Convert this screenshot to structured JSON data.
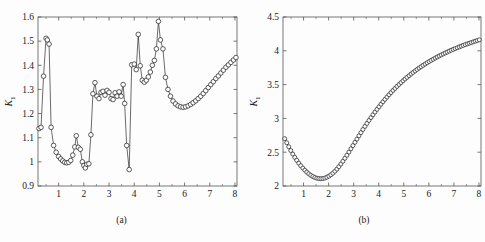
{
  "figure": {
    "background": "#fdfdfd",
    "line_color": "#2b2b2b",
    "marker_edge_color": "#1a1a1a",
    "marker_face_color": "#ffffff",
    "axis_color": "#555555"
  },
  "panels": [
    {
      "id": "a",
      "caption": "(a)",
      "xlabel": "τ",
      "ylabel_base": "K",
      "ylabel_sub": "1"
    },
    {
      "id": "b",
      "caption": "(b)",
      "xlabel": "τ",
      "ylabel_base": "K",
      "ylabel_sub": "1"
    }
  ],
  "chart_data": [
    {
      "type": "line",
      "panel": "a",
      "title": "",
      "subtitle": "(a)",
      "xlabel": "τ",
      "ylabel": "K₁",
      "xlim": [
        0.18,
        8.08
      ],
      "ylim": [
        0.9,
        1.6
      ],
      "xticks": [
        1,
        2,
        3,
        4,
        5,
        6,
        7,
        8
      ],
      "xticklabels": [
        "1",
        "2",
        "3",
        "4",
        "5",
        "6",
        "7",
        "8"
      ],
      "yticks": [
        0.9,
        1.0,
        1.1,
        1.2,
        1.3,
        1.4,
        1.5,
        1.6
      ],
      "yticklabels": [
        "0.9",
        "1",
        "1.1",
        "1.2",
        "1.3",
        "1.4",
        "1.5",
        "1.6"
      ],
      "grid": false,
      "legend": null,
      "marker": "open-circle",
      "x": [
        0.22,
        0.3,
        0.4,
        0.5,
        0.55,
        0.62,
        0.7,
        0.8,
        0.9,
        1.0,
        1.08,
        1.16,
        1.24,
        1.32,
        1.4,
        1.48,
        1.56,
        1.64,
        1.7,
        1.78,
        1.86,
        1.94,
        2.0,
        2.06,
        2.12,
        2.2,
        2.28,
        2.36,
        2.44,
        2.52,
        2.6,
        2.68,
        2.76,
        2.84,
        2.92,
        3.0,
        3.08,
        3.16,
        3.24,
        3.32,
        3.4,
        3.48,
        3.56,
        3.62,
        3.7,
        3.8,
        3.9,
        4.0,
        4.08,
        4.16,
        4.24,
        4.32,
        4.4,
        4.48,
        4.56,
        4.64,
        4.72,
        4.8,
        4.88,
        4.96,
        5.04,
        5.14,
        5.24,
        5.34,
        5.44,
        5.54,
        5.64,
        5.74,
        5.84,
        5.94,
        6.04,
        6.14,
        6.24,
        6.34,
        6.44,
        6.54,
        6.64,
        6.74,
        6.84,
        6.94,
        7.04,
        7.14,
        7.24,
        7.34,
        7.44,
        7.54,
        7.64,
        7.74,
        7.84,
        7.94,
        8.04
      ],
      "y": [
        1.138,
        1.143,
        1.355,
        1.512,
        1.505,
        1.488,
        1.143,
        1.068,
        1.04,
        1.022,
        1.012,
        1.004,
        0.998,
        0.996,
        0.998,
        1.006,
        1.028,
        1.062,
        1.108,
        1.06,
        1.052,
        1.0,
        0.985,
        0.975,
        0.99,
        0.992,
        1.112,
        1.282,
        1.328,
        1.272,
        1.262,
        1.288,
        1.292,
        1.276,
        1.296,
        1.288,
        1.262,
        1.258,
        1.286,
        1.272,
        1.29,
        1.272,
        1.32,
        1.242,
        1.068,
        0.968,
        1.402,
        1.405,
        1.382,
        1.528,
        1.398,
        1.338,
        1.33,
        1.338,
        1.352,
        1.372,
        1.4,
        1.42,
        1.468,
        1.582,
        1.505,
        1.468,
        1.35,
        1.3,
        1.272,
        1.252,
        1.24,
        1.232,
        1.228,
        1.226,
        1.228,
        1.232,
        1.238,
        1.245,
        1.253,
        1.262,
        1.272,
        1.283,
        1.295,
        1.308,
        1.32,
        1.332,
        1.345,
        1.356,
        1.368,
        1.38,
        1.392,
        1.402,
        1.412,
        1.422,
        1.432
      ]
    },
    {
      "type": "line",
      "panel": "b",
      "title": "",
      "subtitle": "(b)",
      "xlabel": "τ",
      "ylabel": "K₁",
      "xlim": [
        0.18,
        8.08
      ],
      "ylim": [
        2.0,
        4.5
      ],
      "xticks": [
        1,
        2,
        3,
        4,
        5,
        6,
        7,
        8
      ],
      "xticklabels": [
        "1",
        "2",
        "3",
        "4",
        "5",
        "6",
        "7",
        "8"
      ],
      "yticks": [
        2.0,
        2.5,
        3.0,
        3.5,
        4.0,
        4.5
      ],
      "yticklabels": [
        "2",
        "2.5",
        "3",
        "3.5",
        "4",
        "4.5"
      ],
      "grid": false,
      "legend": null,
      "marker": "open-circle",
      "x": [
        0.25,
        0.33,
        0.41,
        0.49,
        0.57,
        0.65,
        0.73,
        0.81,
        0.89,
        0.97,
        1.05,
        1.13,
        1.21,
        1.29,
        1.37,
        1.45,
        1.53,
        1.61,
        1.69,
        1.77,
        1.85,
        1.93,
        2.01,
        2.09,
        2.17,
        2.25,
        2.33,
        2.41,
        2.49,
        2.57,
        2.65,
        2.73,
        2.81,
        2.89,
        2.97,
        3.05,
        3.13,
        3.21,
        3.29,
        3.37,
        3.45,
        3.53,
        3.61,
        3.69,
        3.77,
        3.85,
        3.93,
        4.01,
        4.09,
        4.17,
        4.25,
        4.33,
        4.41,
        4.49,
        4.57,
        4.65,
        4.73,
        4.81,
        4.89,
        4.97,
        5.05,
        5.13,
        5.21,
        5.29,
        5.37,
        5.45,
        5.53,
        5.61,
        5.69,
        5.77,
        5.85,
        5.93,
        6.01,
        6.09,
        6.17,
        6.25,
        6.33,
        6.41,
        6.49,
        6.57,
        6.65,
        6.73,
        6.81,
        6.89,
        6.97,
        7.05,
        7.13,
        7.21,
        7.29,
        7.37,
        7.45,
        7.53,
        7.61,
        7.69,
        7.77,
        7.85,
        7.93,
        8.01
      ],
      "y": [
        2.7,
        2.64,
        2.58,
        2.525,
        2.472,
        2.424,
        2.38,
        2.338,
        2.3,
        2.265,
        2.234,
        2.205,
        2.18,
        2.158,
        2.14,
        2.126,
        2.116,
        2.11,
        2.108,
        2.11,
        2.118,
        2.13,
        2.146,
        2.166,
        2.19,
        2.218,
        2.25,
        2.286,
        2.325,
        2.366,
        2.41,
        2.455,
        2.502,
        2.55,
        2.598,
        2.646,
        2.694,
        2.742,
        2.79,
        2.836,
        2.882,
        2.926,
        2.97,
        3.012,
        3.054,
        3.094,
        3.134,
        3.172,
        3.21,
        3.246,
        3.282,
        3.316,
        3.35,
        3.382,
        3.414,
        3.444,
        3.474,
        3.502,
        3.53,
        3.557,
        3.583,
        3.608,
        3.633,
        3.657,
        3.68,
        3.702,
        3.724,
        3.745,
        3.765,
        3.785,
        3.804,
        3.823,
        3.841,
        3.858,
        3.875,
        3.892,
        3.908,
        3.923,
        3.938,
        3.953,
        3.967,
        3.981,
        3.995,
        4.008,
        4.021,
        4.033,
        4.045,
        4.057,
        4.069,
        4.08,
        4.091,
        4.102,
        4.112,
        4.122,
        4.132,
        4.142,
        4.152,
        4.162,
        4.252
      ]
    }
  ]
}
